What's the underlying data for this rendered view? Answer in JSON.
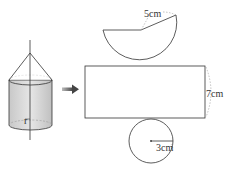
{
  "diagram": {
    "labels": {
      "slant": "5cm",
      "height": "7cm",
      "radius": "3cm",
      "solid_radius": "r"
    },
    "colors": {
      "stroke": "#333333",
      "dashed": "#999999",
      "cylinder_fill": "#d8d8d8",
      "arrow": "#555555"
    }
  }
}
